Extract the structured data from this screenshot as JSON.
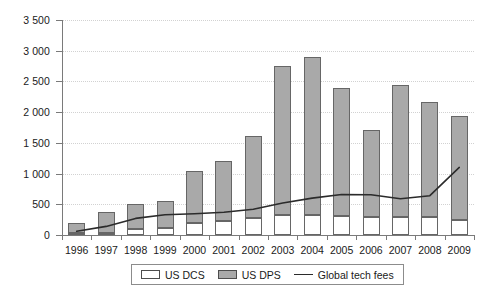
{
  "chart_data": {
    "type": "bar",
    "subtype": "stacked-bar-with-line-overlay",
    "title": "",
    "subtitle": "",
    "xlabel": "",
    "ylabel": "",
    "ylim": [
      0,
      3500
    ],
    "ytick_step": 500,
    "ytick_labels": [
      "0",
      "500",
      "1 000",
      "1 500",
      "2 000",
      "2 500",
      "3 000",
      "3 500"
    ],
    "ytick_values": [
      0,
      500,
      1000,
      1500,
      2000,
      2500,
      3000,
      3500
    ],
    "grid": true,
    "grid_style": "dotted-horizontal",
    "legend_position": "bottom-center",
    "categories": [
      "1996",
      "1997",
      "1998",
      "1999",
      "2000",
      "2001",
      "2002",
      "2003",
      "2004",
      "2005",
      "2006",
      "2007",
      "2008",
      "2009"
    ],
    "series": [
      {
        "name": "US DCS",
        "type": "bar-segment-bottom",
        "color": "#ffffff",
        "border": "#666666",
        "values": [
          25,
          30,
          90,
          120,
          200,
          230,
          270,
          330,
          330,
          310,
          300,
          290,
          290,
          250
        ]
      },
      {
        "name": "US DPS",
        "type": "bar-segment-top",
        "color": "#a9a9a9",
        "border": "#666666",
        "values": [
          175,
          345,
          420,
          435,
          850,
          980,
          1350,
          2420,
          2570,
          2080,
          1410,
          2160,
          1870,
          1690
        ]
      },
      {
        "name": "Global tech fees",
        "type": "line",
        "color": "#2b2b2b",
        "values": [
          60,
          140,
          270,
          330,
          345,
          370,
          420,
          520,
          600,
          660,
          655,
          590,
          640,
          1100
        ]
      }
    ],
    "totals": [
      200,
      375,
      510,
      555,
      1050,
      1210,
      1620,
      2750,
      2900,
      2390,
      1710,
      2450,
      2160,
      1940
    ]
  },
  "legend": {
    "items": [
      {
        "label": "US DCS",
        "marker": "swatch-white"
      },
      {
        "label": "US DPS",
        "marker": "swatch-gray"
      },
      {
        "label": "Global tech fees",
        "marker": "line-black"
      }
    ]
  }
}
